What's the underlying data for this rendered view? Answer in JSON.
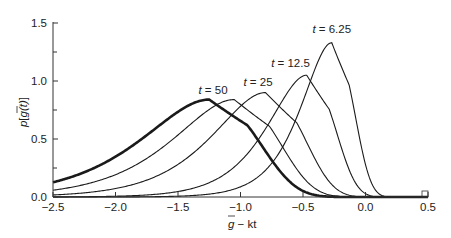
{
  "chart_data": {
    "type": "line",
    "title": "",
    "xlabel": "g̅ − kt",
    "ylabel": "p[g̅(t)]",
    "xlim": [
      -2.5,
      0.5
    ],
    "ylim": [
      0.0,
      1.5
    ],
    "xticks": [
      -2.5,
      -2.0,
      -1.5,
      -1.0,
      -0.5,
      0.0,
      0.5
    ],
    "xtick_labels": [
      "−2.5",
      "−2.0",
      "−1.5",
      "−1.0",
      "−0.5",
      "0.0",
      "0.5"
    ],
    "yticks": [
      0.0,
      0.5,
      1.0,
      1.5
    ],
    "ytick_labels": [
      "0.0",
      "0.5",
      "1.0",
      "1.5"
    ],
    "y_minor_ticks": [
      0.25,
      0.75,
      1.25
    ],
    "grid": false,
    "legend": "none (curves labeled inline)",
    "series": [
      {
        "name": "asymptotic (thick)",
        "label": "",
        "peak_x": -1.25,
        "peak_y": 0.84,
        "width": 1.05,
        "thick": true
      },
      {
        "name": "t = 50",
        "label": "t = 50",
        "peak_x": -1.05,
        "peak_y": 0.84,
        "width": 0.95,
        "thick": false,
        "label_x": -1.22,
        "label_y": 0.89
      },
      {
        "name": "t = 25",
        "label": "t = 25",
        "peak_x": -0.8,
        "peak_y": 0.9,
        "width": 0.82,
        "thick": false,
        "label_x": -0.86,
        "label_y": 0.96
      },
      {
        "name": "t = 12.5",
        "label": "t = 12.5",
        "peak_x": -0.47,
        "peak_y": 1.05,
        "width": 0.6,
        "thick": false,
        "label_x": -0.6,
        "label_y": 1.12
      },
      {
        "name": "t = 6.25",
        "label": "t = 6.25",
        "peak_x": -0.27,
        "peak_y": 1.33,
        "width": 0.47,
        "thick": false,
        "label_x": -0.27,
        "label_y": 1.41
      }
    ]
  },
  "axes": {
    "x_label_main": "g",
    "x_label_rest": " − kt",
    "y_label_p": "p",
    "y_label_g": "g",
    "y_label_t": "(t)"
  }
}
